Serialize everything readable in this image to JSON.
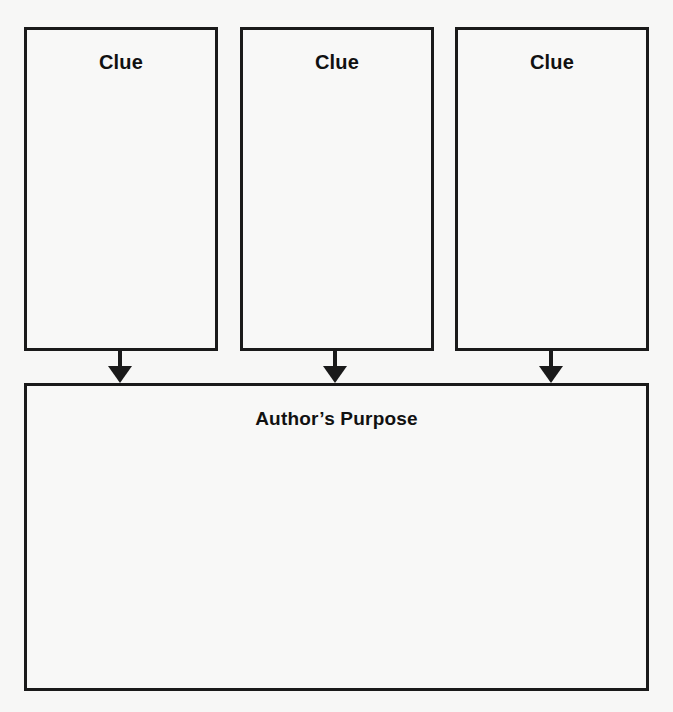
{
  "diagram": {
    "type": "graphic-organizer",
    "clues": [
      {
        "label": "Clue",
        "content": ""
      },
      {
        "label": "Clue",
        "content": ""
      },
      {
        "label": "Clue",
        "content": ""
      }
    ],
    "result": {
      "label": "Author’s Purpose",
      "content": ""
    },
    "edges": [
      {
        "from": "clue-1",
        "to": "authors-purpose"
      },
      {
        "from": "clue-2",
        "to": "authors-purpose"
      },
      {
        "from": "clue-3",
        "to": "authors-purpose"
      }
    ],
    "colors": {
      "stroke": "#1a1a1a",
      "background": "#f7f7f6",
      "text": "#111111"
    }
  }
}
